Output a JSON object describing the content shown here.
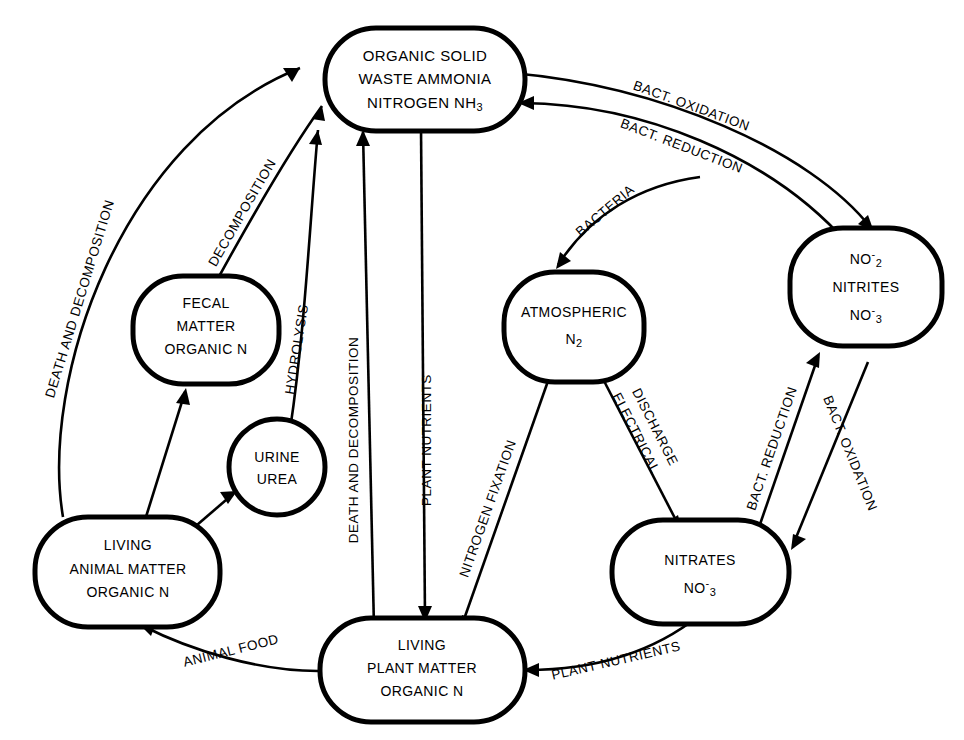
{
  "diagram": {
    "background_color": "#ffffff",
    "line_color": "#000000",
    "nodes": [
      {
        "id": "ammonia",
        "name": "organic-solid-waste-ammonia",
        "shape": "rounded-rect",
        "lines": [
          "ORGANIC SOLID",
          "WASTE AMMONIA",
          "NITROGEN NH3"
        ],
        "line3_prefix": "NITROGEN NH",
        "line3_sub": "3"
      },
      {
        "id": "fecal",
        "name": "fecal-matter-organic-n",
        "shape": "rounded-rect",
        "lines": [
          "FECAL",
          "MATTER",
          "ORGANIC N"
        ]
      },
      {
        "id": "urine",
        "name": "urine-urea",
        "shape": "circle",
        "lines": [
          "URINE",
          "UREA"
        ]
      },
      {
        "id": "animal",
        "name": "living-animal-matter-organic-n",
        "shape": "rounded-rect",
        "lines": [
          "LIVING",
          "ANIMAL MATTER",
          "ORGANIC N"
        ]
      },
      {
        "id": "plant",
        "name": "living-plant-matter-organic-n",
        "shape": "rounded-rect",
        "lines": [
          "LIVING",
          "PLANT MATTER",
          "ORGANIC N"
        ]
      },
      {
        "id": "atmospheric",
        "name": "atmospheric-n2",
        "shape": "rounded-rect",
        "lines": [
          "ATMOSPHERIC",
          "N2"
        ],
        "line2_prefix": "N",
        "line2_sub": "2"
      },
      {
        "id": "nitrites",
        "name": "nitrites-no2-no3",
        "shape": "rounded-rect",
        "lines": [
          "NO2-",
          "NITRITES",
          "NO3-"
        ],
        "line1_prefix": "NO",
        "line1_sub": "2",
        "line1_sup": "-",
        "line3_prefix": "NO",
        "line3_sub": "3",
        "line3_sup": "-"
      },
      {
        "id": "nitrates",
        "name": "nitrates-no3",
        "shape": "rounded-rect",
        "lines": [
          "NITRATES",
          "NO3-"
        ],
        "line2_prefix": "NO",
        "line2_sub": "3",
        "line2_sup": "-"
      }
    ],
    "edges": [
      {
        "id": "e1",
        "name": "edge-death-and-decomposition-animal-to-ammonia",
        "label": "DEATH AND DECOMPOSITION",
        "from": "animal",
        "to": "ammonia"
      },
      {
        "id": "e2",
        "name": "edge-decomposition-fecal-to-ammonia",
        "label": "DECOMPOSITION",
        "from": "fecal",
        "to": "ammonia"
      },
      {
        "id": "e3",
        "name": "edge-hydrolysis-urine-to-ammonia",
        "label": "HYDROLYSIS",
        "from": "urine",
        "to": "ammonia"
      },
      {
        "id": "e4",
        "name": "edge-death-and-decomposition-plant-to-ammonia",
        "label": "DEATH AND DECOMPOSITION",
        "from": "plant",
        "to": "ammonia"
      },
      {
        "id": "e5",
        "name": "edge-plant-nutrients-ammonia-to-plant",
        "label": "PLANT NUTRIENTS",
        "from": "ammonia",
        "to": "plant"
      },
      {
        "id": "e6",
        "name": "edge-animal-to-fecal",
        "label": "",
        "from": "animal",
        "to": "fecal"
      },
      {
        "id": "e7",
        "name": "edge-animal-to-urine",
        "label": "",
        "from": "animal",
        "to": "urine"
      },
      {
        "id": "e8",
        "name": "edge-animal-food-plant-to-animal",
        "label": "ANIMAL FOOD",
        "from": "plant",
        "to": "animal"
      },
      {
        "id": "e9",
        "name": "edge-bact-oxidation-ammonia-to-nitrites",
        "label": "BACT. OXIDATION",
        "from": "ammonia",
        "to": "nitrites"
      },
      {
        "id": "e10",
        "name": "edge-bact-reduction-nitrites-to-ammonia",
        "label": "BACT. REDUCTION",
        "from": "nitrites",
        "to": "ammonia"
      },
      {
        "id": "e11",
        "name": "edge-bacteria-to-atmospheric",
        "label": "BACTERIA",
        "from": "nitrites",
        "to": "atmospheric"
      },
      {
        "id": "e12",
        "name": "edge-nitrogen-fixation-atmospheric-to-plant",
        "label": "NITROGEN FIXATION",
        "from": "atmospheric",
        "to": "plant"
      },
      {
        "id": "e13",
        "name": "edge-electrical-discharge-atmospheric-to-nitrates",
        "label": "ELECTRICAL",
        "label2": "DISCHARGE",
        "from": "atmospheric",
        "to": "nitrates"
      },
      {
        "id": "e14",
        "name": "edge-bact-reduction-nitrites-to-nitrates",
        "label": "BACT. REDUCTION",
        "from": "nitrates",
        "to": "nitrites"
      },
      {
        "id": "e15",
        "name": "edge-bact-oxidation-nitrites-to-nitrates",
        "label": "BACT. OXIDATION",
        "from": "nitrites",
        "to": "nitrates"
      },
      {
        "id": "e16",
        "name": "edge-plant-nutrients-nitrates-to-plant",
        "label": "PLANT NUTRIENTS",
        "from": "nitrates",
        "to": "plant"
      }
    ]
  }
}
